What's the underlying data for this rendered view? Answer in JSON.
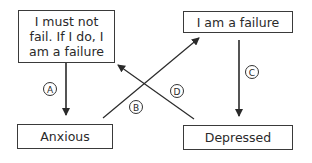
{
  "nodes": {
    "belief": "I must not fail. If I do, I am a failure",
    "failure": "I am a failure",
    "anxious": "Anxious",
    "depressed": "Depressed"
  },
  "edges": [
    {
      "label": "A",
      "from": "belief",
      "to": "anxious"
    },
    {
      "label": "B",
      "from": "anxious",
      "to": "failure"
    },
    {
      "label": "C",
      "from": "failure",
      "to": "depressed"
    },
    {
      "label": "D",
      "from": "depressed",
      "to": "belief"
    }
  ]
}
